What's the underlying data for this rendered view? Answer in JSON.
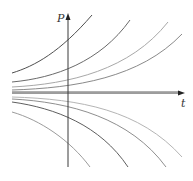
{
  "figure": {
    "type": "solution-curves",
    "axes": {
      "x_label": "t",
      "y_label": "P"
    },
    "colors": {
      "axis": "#3a3a3a",
      "curve_dark": "#555555",
      "curve_mid": "#888888",
      "curve_light": "#b0b0b0"
    },
    "curves": [
      {
        "name": "growth-curve-1",
        "direction": "up"
      },
      {
        "name": "growth-curve-2",
        "direction": "up"
      },
      {
        "name": "growth-curve-3",
        "direction": "up"
      },
      {
        "name": "growth-curve-4",
        "direction": "up"
      },
      {
        "name": "equilibrium-line",
        "direction": "flat"
      },
      {
        "name": "decay-curve-1",
        "direction": "down"
      },
      {
        "name": "decay-curve-2",
        "direction": "down"
      },
      {
        "name": "decay-curve-3",
        "direction": "down"
      },
      {
        "name": "decay-curve-4",
        "direction": "down"
      }
    ]
  }
}
